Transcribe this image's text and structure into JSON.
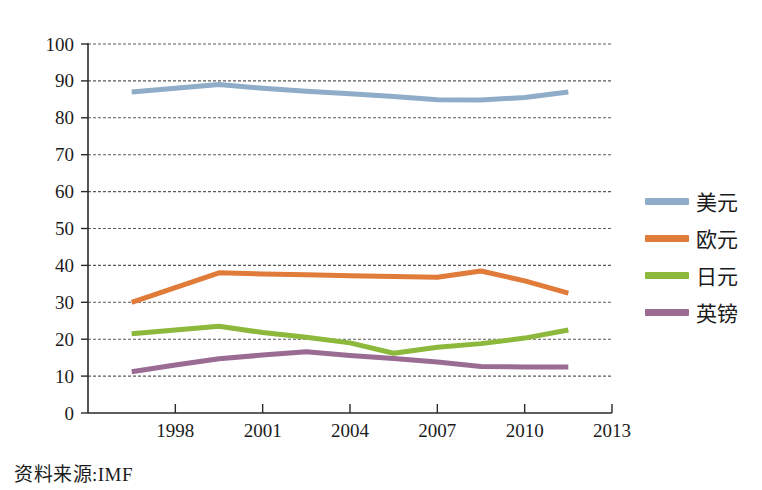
{
  "source_note": "资料来源:IMF",
  "legend": {
    "position": "right",
    "entries": [
      {
        "label": "美元",
        "color": "#8fadc8",
        "swatch_name": "legend-swatch-usd"
      },
      {
        "label": "欧元",
        "color": "#e07b39",
        "swatch_name": "legend-swatch-eur"
      },
      {
        "label": "日元",
        "color": "#8cb83c",
        "swatch_name": "legend-swatch-jpy"
      },
      {
        "label": "英镑",
        "color": "#9a6b93",
        "swatch_name": "legend-swatch-gbp"
      }
    ]
  },
  "chart_data": {
    "type": "line",
    "title": "",
    "subtitle": "",
    "xlabel": "",
    "ylabel": "",
    "xlim": [
      1995,
      2013
    ],
    "ylim": [
      0,
      100
    ],
    "xticks": [
      1998,
      2001,
      2004,
      2007,
      2010,
      2013
    ],
    "xtick_labels": [
      "1998",
      "2001",
      "2004",
      "2007",
      "2010",
      "2013"
    ],
    "yticks": [
      0,
      10,
      20,
      30,
      40,
      50,
      60,
      70,
      80,
      90,
      100
    ],
    "ytick_labels": [
      "0",
      "10",
      "20",
      "30",
      "40",
      "50",
      "60",
      "70",
      "80",
      "90",
      "100"
    ],
    "grid": "horizontal-dashed",
    "legend_position": "right",
    "x": [
      1996.5,
      1998,
      1999.5,
      2001,
      2002.5,
      2004,
      2005.5,
      2007,
      2008.5,
      2010,
      2011.5
    ],
    "series": [
      {
        "name": "美元",
        "color": "#8fadc8",
        "values": [
          87.0,
          88.0,
          89.0,
          88.0,
          87.2,
          86.5,
          85.8,
          84.9,
          84.8,
          85.5,
          87.0
        ]
      },
      {
        "name": "欧元",
        "color": "#e07b39",
        "values": [
          30.0,
          34.0,
          38.0,
          37.7,
          37.5,
          37.2,
          37.0,
          36.8,
          38.5,
          35.8,
          32.5
        ]
      },
      {
        "name": "日元",
        "color": "#8cb83c",
        "values": [
          21.5,
          22.5,
          23.5,
          21.8,
          20.5,
          19.0,
          16.2,
          17.8,
          18.8,
          20.3,
          22.5
        ]
      },
      {
        "name": "英镑",
        "color": "#9a6b93",
        "values": [
          11.2,
          13.0,
          14.7,
          15.7,
          16.6,
          15.6,
          14.8,
          13.8,
          12.6,
          12.5,
          12.5
        ]
      }
    ]
  }
}
